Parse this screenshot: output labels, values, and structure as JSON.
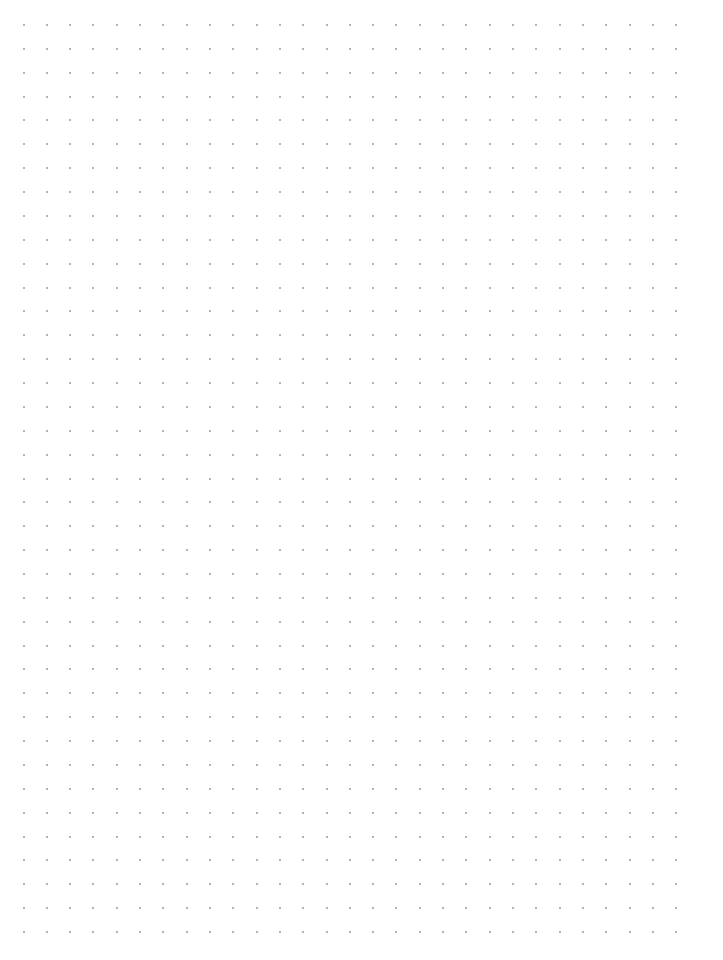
{
  "page": {
    "type": "dot-grid-paper",
    "background_color": "#ffffff",
    "dot_color": "#9a9a9a",
    "dot_size_px": 2
  },
  "grid": {
    "columns": 29,
    "rows": 39,
    "origin_x": 23.5,
    "origin_y": 25,
    "spacing_x": 23.31,
    "spacing_y": 23.87
  }
}
